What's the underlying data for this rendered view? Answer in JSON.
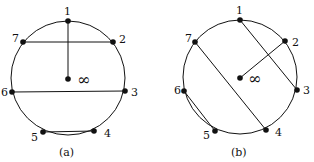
{
  "diagrams": [
    {
      "id": "a",
      "caption": "(a)",
      "circle": {
        "cx": 68,
        "cy": 78,
        "r": 57
      },
      "center_label": "∞",
      "nodes": [
        {
          "label": "1",
          "x": 68,
          "y": 21
        },
        {
          "label": "2",
          "x": 113,
          "y": 42
        },
        {
          "label": "3",
          "x": 125,
          "y": 91
        },
        {
          "label": "4",
          "x": 94,
          "y": 131
        },
        {
          "label": "5",
          "x": 43,
          "y": 132
        },
        {
          "label": "6",
          "x": 12,
          "y": 92
        },
        {
          "label": "7",
          "x": 23,
          "y": 42
        }
      ],
      "edges": [
        [
          "1",
          "∞"
        ],
        [
          "7",
          "2"
        ],
        [
          "6",
          "3"
        ],
        [
          "5",
          "4"
        ]
      ]
    },
    {
      "id": "b",
      "caption": "(b)",
      "circle": {
        "cx": 240,
        "cy": 78,
        "r": 57
      },
      "center_label": "∞",
      "nodes": [
        {
          "label": "1",
          "x": 240,
          "y": 20
        },
        {
          "label": "2",
          "x": 285,
          "y": 41
        },
        {
          "label": "3",
          "x": 297,
          "y": 90
        },
        {
          "label": "4",
          "x": 266,
          "y": 130
        },
        {
          "label": "5",
          "x": 215,
          "y": 131
        },
        {
          "label": "6",
          "x": 184,
          "y": 91
        },
        {
          "label": "7",
          "x": 195,
          "y": 42
        }
      ],
      "edges": [
        [
          "1",
          "3"
        ],
        [
          "2",
          "∞"
        ],
        [
          "7",
          "4"
        ],
        [
          "6",
          "5"
        ]
      ]
    }
  ]
}
